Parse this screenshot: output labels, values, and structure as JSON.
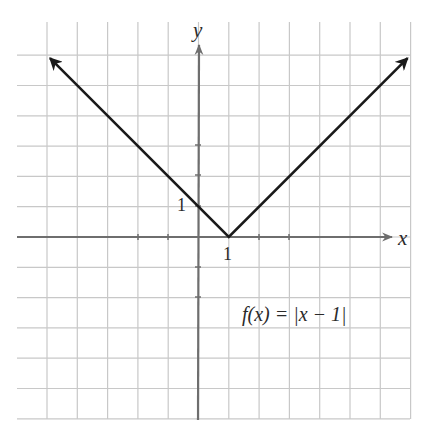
{
  "chart_data": {
    "type": "line",
    "title": "",
    "function_label": "f(x) = |x − 1|",
    "xlabel": "x",
    "ylabel": "y",
    "x_tick_label": "1",
    "y_tick_label": "1",
    "xlim": [
      -5,
      7
    ],
    "ylim": [
      -6,
      6
    ],
    "grid": true,
    "legend": "none",
    "series": [
      {
        "name": "f(x) = |x − 1|",
        "x": [
          -4.9,
          1,
          6.9
        ],
        "y": [
          5.9,
          0,
          5.9
        ],
        "arrows": [
          "start",
          "end"
        ]
      }
    ],
    "vertex": {
      "x": 1,
      "y": 0
    },
    "y_intercept": {
      "x": 0,
      "y": 1
    }
  },
  "labels": {
    "x_axis": "x",
    "y_axis": "y",
    "tick_x": "1",
    "tick_y": "1",
    "function": "f(x) = |x − 1|"
  },
  "colors": {
    "grid": "#c8c8c8",
    "axis": "#6e6e6e",
    "curve": "#1a1a1a",
    "text": "#2a2a2a"
  }
}
